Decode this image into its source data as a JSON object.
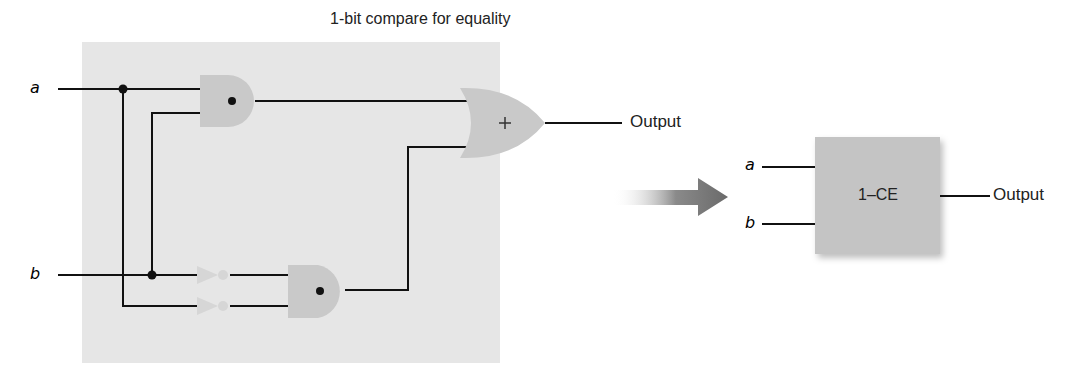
{
  "title": "1-bit compare for equality",
  "inputs": {
    "a": "a",
    "b": "b"
  },
  "gates": {
    "and_top": {
      "type": "AND",
      "symbol": "•"
    },
    "and_bottom": {
      "type": "AND",
      "symbol": "•"
    },
    "or": {
      "type": "OR",
      "symbol": "+"
    },
    "not_b": {
      "type": "NOT"
    },
    "not_a": {
      "type": "NOT"
    }
  },
  "output_label": "Output",
  "block": {
    "name": "1–CE",
    "input_a": "a",
    "input_b": "b",
    "output": "Output"
  },
  "colors": {
    "panel": "#e6e6e6",
    "gate": "#c9c9c9",
    "inverter": "#d6d6d6",
    "wire": "#111111",
    "arrow": "#6f6f6f",
    "block": "#c4c4c4"
  }
}
